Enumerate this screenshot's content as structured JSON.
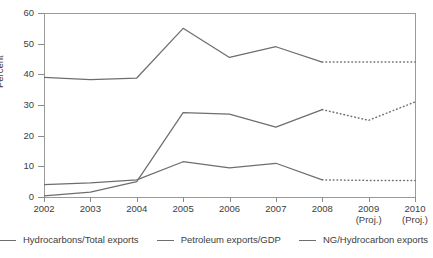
{
  "chart_data": {
    "type": "line",
    "title": "",
    "xlabel": "",
    "ylabel": "Percent",
    "ylim": [
      0,
      60
    ],
    "yticks": [
      0,
      10,
      20,
      30,
      40,
      50,
      60
    ],
    "grid": false,
    "legend_position": "bottom",
    "categories": [
      "2002",
      "2003",
      "2004",
      "2005",
      "2006",
      "2007",
      "2008",
      "2009 (Proj.)",
      "2010 (Proj.)"
    ],
    "x_tick_labels": [
      {
        "year": "2002",
        "proj": ""
      },
      {
        "year": "2003",
        "proj": ""
      },
      {
        "year": "2004",
        "proj": ""
      },
      {
        "year": "2005",
        "proj": ""
      },
      {
        "year": "2006",
        "proj": ""
      },
      {
        "year": "2007",
        "proj": ""
      },
      {
        "year": "2008",
        "proj": ""
      },
      {
        "year": "2009",
        "proj": "(Proj.)"
      },
      {
        "year": "2010",
        "proj": "(Proj.)"
      }
    ],
    "projection_starts_at": "2008",
    "series": [
      {
        "name": "Hydrocarbons/Total exports",
        "color": "#6e6e6e",
        "values": [
          39.0,
          38.3,
          38.8,
          55.0,
          45.5,
          49.0,
          44.0,
          44.0,
          44.0
        ]
      },
      {
        "name": "Petroleum exports/GDP",
        "color": "#6e6e6e",
        "values": [
          4.0,
          4.6,
          5.6,
          11.5,
          9.5,
          11.0,
          5.6,
          5.4,
          5.4
        ]
      },
      {
        "name": "NG/Hydrocarbon exports",
        "color": "#6e6e6e",
        "values": [
          0.4,
          1.6,
          5.0,
          27.5,
          27.0,
          22.8,
          28.5,
          25.0,
          31.0
        ]
      }
    ]
  },
  "axis": {
    "y_title": "Percent"
  },
  "clipped_title": "..."
}
